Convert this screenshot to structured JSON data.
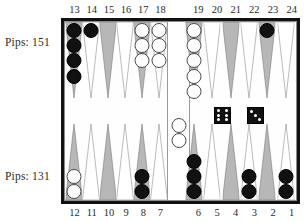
{
  "app": {
    "title": "Backgammon Board Position"
  },
  "players": {
    "top": {
      "pips_label": "Pips: 151",
      "pips": 151,
      "checker_color": "black"
    },
    "bottom": {
      "pips_label": "Pips: 131",
      "pips": 131,
      "checker_color": "white"
    }
  },
  "point_numbers": {
    "top_left": [
      "13",
      "14",
      "15",
      "16",
      "17",
      "18"
    ],
    "top_right": [
      "19",
      "20",
      "21",
      "22",
      "23",
      "24"
    ],
    "bottom_left": [
      "12",
      "11",
      "10",
      "9",
      "8",
      "7"
    ],
    "bottom_right": [
      "6",
      "5",
      "4",
      "3",
      "2",
      "1"
    ]
  },
  "dice": [
    {
      "name": "die-left",
      "value": 6
    },
    {
      "name": "die-right",
      "value": 3
    }
  ],
  "bar": {
    "white_checkers": 2,
    "black_checkers": 0
  },
  "colors": {
    "board_border": "#111111",
    "point_dark": "#9a9a9a",
    "point_light": "#ffffff",
    "checker_black": "#111111",
    "checker_white": "#ffffff",
    "text": "#2b2b2b"
  },
  "chart_data": {
    "type": "table",
    "categories": [
      "1",
      "2",
      "3",
      "4",
      "5",
      "6",
      "7",
      "8",
      "9",
      "10",
      "11",
      "12",
      "13",
      "14",
      "15",
      "16",
      "17",
      "18",
      "19",
      "20",
      "21",
      "22",
      "23",
      "24"
    ],
    "series": [
      {
        "name": "black",
        "values": [
          2,
          0,
          2,
          0,
          0,
          3,
          0,
          2,
          0,
          0,
          0,
          0,
          4,
          1,
          0,
          0,
          0,
          0,
          0,
          0,
          0,
          0,
          1,
          0
        ]
      },
      {
        "name": "white",
        "values": [
          0,
          0,
          0,
          0,
          0,
          0,
          0,
          0,
          0,
          0,
          0,
          2,
          0,
          0,
          0,
          0,
          3,
          3,
          5,
          0,
          0,
          0,
          0,
          0
        ]
      }
    ],
    "annotations": [
      "Pips: 151",
      "Pips: 131",
      "dice 6-3",
      "bar: 2 white"
    ]
  },
  "points": [
    {
      "num": "13",
      "quad": "top_left",
      "index": 0,
      "shade": "dark",
      "color": "black",
      "count": 4
    },
    {
      "num": "14",
      "quad": "top_left",
      "index": 1,
      "shade": "light",
      "color": "black",
      "count": 1
    },
    {
      "num": "15",
      "quad": "top_left",
      "index": 2,
      "shade": "dark",
      "color": "none",
      "count": 0
    },
    {
      "num": "16",
      "quad": "top_left",
      "index": 3,
      "shade": "light",
      "color": "none",
      "count": 0
    },
    {
      "num": "17",
      "quad": "top_left",
      "index": 4,
      "shade": "dark",
      "color": "white",
      "count": 3
    },
    {
      "num": "18",
      "quad": "top_left",
      "index": 5,
      "shade": "light",
      "color": "white",
      "count": 3
    },
    {
      "num": "19",
      "quad": "top_right",
      "index": 0,
      "shade": "dark",
      "color": "white",
      "count": 5
    },
    {
      "num": "20",
      "quad": "top_right",
      "index": 1,
      "shade": "light",
      "color": "none",
      "count": 0
    },
    {
      "num": "21",
      "quad": "top_right",
      "index": 2,
      "shade": "dark",
      "color": "none",
      "count": 0
    },
    {
      "num": "22",
      "quad": "top_right",
      "index": 3,
      "shade": "light",
      "color": "none",
      "count": 0
    },
    {
      "num": "23",
      "quad": "top_right",
      "index": 4,
      "shade": "dark",
      "color": "black",
      "count": 1
    },
    {
      "num": "24",
      "quad": "top_right",
      "index": 5,
      "shade": "light",
      "color": "none",
      "count": 0
    },
    {
      "num": "12",
      "quad": "bottom_left",
      "index": 0,
      "shade": "dark",
      "color": "white",
      "count": 2
    },
    {
      "num": "11",
      "quad": "bottom_left",
      "index": 1,
      "shade": "light",
      "color": "none",
      "count": 0
    },
    {
      "num": "10",
      "quad": "bottom_left",
      "index": 2,
      "shade": "dark",
      "color": "none",
      "count": 0
    },
    {
      "num": "9",
      "quad": "bottom_left",
      "index": 3,
      "shade": "light",
      "color": "none",
      "count": 0
    },
    {
      "num": "8",
      "quad": "bottom_left",
      "index": 4,
      "shade": "dark",
      "color": "black",
      "count": 2
    },
    {
      "num": "7",
      "quad": "bottom_left",
      "index": 5,
      "shade": "light",
      "color": "none",
      "count": 0
    },
    {
      "num": "6",
      "quad": "bottom_right",
      "index": 0,
      "shade": "dark",
      "color": "black",
      "count": 3
    },
    {
      "num": "5",
      "quad": "bottom_right",
      "index": 1,
      "shade": "light",
      "color": "none",
      "count": 0
    },
    {
      "num": "4",
      "quad": "bottom_right",
      "index": 2,
      "shade": "dark",
      "color": "none",
      "count": 0
    },
    {
      "num": "3",
      "quad": "bottom_right",
      "index": 3,
      "shade": "light",
      "color": "black",
      "count": 2
    },
    {
      "num": "2",
      "quad": "bottom_right",
      "index": 4,
      "shade": "dark",
      "color": "none",
      "count": 0
    },
    {
      "num": "1",
      "quad": "bottom_right",
      "index": 5,
      "shade": "light",
      "color": "black",
      "count": 2
    }
  ]
}
